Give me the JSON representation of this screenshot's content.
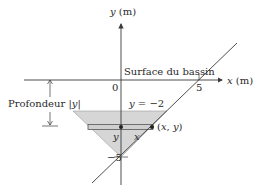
{
  "diagram": {
    "y_axis_label": "y (m)",
    "x_axis_label": "x (m)",
    "origin_label": "0",
    "x_tick_label": "5",
    "y_tick_label": "−5",
    "surface_label": "Surface du bassin",
    "depth_label": "Profondeur |y|",
    "level_label": "y = −2",
    "point_label": "(x, y)",
    "strip_y_label": "y",
    "strip_x_label": "x",
    "colors": {
      "line": "#3a3a3a",
      "shade": "#d6d6d6",
      "text": "#2a2a2a"
    }
  }
}
